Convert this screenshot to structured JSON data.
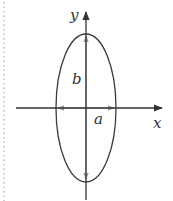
{
  "diagram": {
    "axes": {
      "x_label": "x",
      "y_label": "y"
    },
    "semi_axes": {
      "horizontal_label": "a",
      "vertical_label": "b"
    },
    "colors": {
      "axis": "#333333",
      "ellipse": "#3a3a3a",
      "measure_arrows": "#9a9a9a",
      "dotted_border": "#b0b0b0",
      "background": "#ffffff"
    }
  }
}
